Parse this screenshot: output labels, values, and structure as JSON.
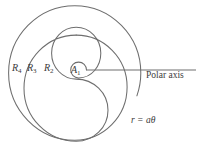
{
  "figure": {
    "type": "archimedean-spiral-diagram",
    "stroke_color": "#6e6e6e",
    "text_color": "#3a3a3a",
    "background_color": "#ffffff",
    "labels": {
      "region_4": "R",
      "region_4_sub": "4",
      "region_3": "R",
      "region_3_sub": "3",
      "region_2": "R",
      "region_2_sub": "2",
      "area_1": "A",
      "area_1_sub": "1",
      "polar_axis": "Polar axis",
      "equation_r": "r",
      "equation_eq": " = ",
      "equation_a": "a",
      "equation_theta": "θ"
    }
  }
}
